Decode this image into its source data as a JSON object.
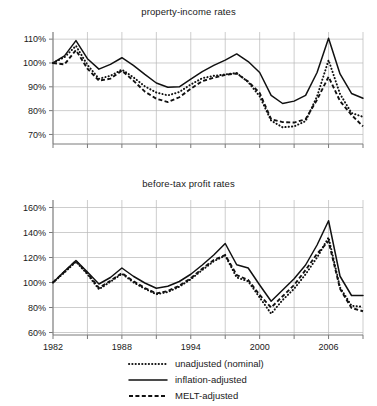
{
  "figure": {
    "width": 377,
    "height": 406,
    "background": "#ffffff",
    "ink_color": "#111111",
    "grid_color": "#b8b8b8",
    "axis_color": "#7a7a7a"
  },
  "legend": {
    "position": "bottom-center",
    "entries": [
      {
        "label": "unadjusted (nominal)",
        "style": "dotted",
        "name": "legend-item-unadjusted"
      },
      {
        "label": "inflation-adjusted",
        "style": "solid",
        "name": "legend-item-inflation-adjusted"
      },
      {
        "label": "MELT-adjusted",
        "style": "dashed",
        "name": "legend-item-melt-adjusted"
      }
    ]
  },
  "chart_data": [
    {
      "type": "line",
      "title": "property-income rates",
      "xlabel": "",
      "ylabel": "",
      "grid": true,
      "legend_position": "bottom-center",
      "xlim": [
        1982,
        1908.0
      ],
      "x_axis_range": [
        1982,
        2009
      ],
      "ylim": [
        66,
        113
      ],
      "yticks": [
        70,
        80,
        90,
        100,
        110
      ],
      "ytick_labels": [
        "70%",
        "80%",
        "90%",
        "100%",
        "110%"
      ],
      "xticks": [
        1982,
        1985,
        1988,
        1991,
        1994,
        1997,
        2000,
        2003,
        2006,
        2009
      ],
      "xtick_labels": [
        "1982",
        "",
        "1988",
        "",
        "1994",
        "",
        "2000",
        "",
        "2006",
        ""
      ],
      "x": [
        1982,
        1983,
        1984,
        1985,
        1986,
        1987,
        1988,
        1989,
        1990,
        1991,
        1992,
        1993,
        1994,
        1995,
        1996,
        1997,
        1998,
        1999,
        2000,
        2001,
        2002,
        2003,
        2004,
        2005,
        2006,
        2007,
        2008,
        2009
      ],
      "series": [
        {
          "name": "inflation-adjusted",
          "style": "solid",
          "values": [
            100.0,
            103.0,
            109.4,
            101.8,
            97.4,
            99.4,
            102.2,
            99.0,
            95.2,
            91.6,
            89.8,
            90.0,
            93.2,
            96.4,
            99.0,
            101.2,
            103.8,
            100.6,
            96.0,
            86.4,
            83.0,
            84.0,
            86.4,
            96.0,
            110.4,
            95.4,
            87.2,
            85.2
          ]
        },
        {
          "name": "unadjusted (nominal)",
          "style": "dotted",
          "values": [
            100.0,
            102.4,
            107.2,
            99.2,
            93.4,
            94.6,
            97.2,
            94.0,
            90.2,
            87.6,
            86.4,
            87.8,
            91.0,
            93.6,
            94.6,
            95.2,
            95.8,
            92.0,
            86.0,
            75.8,
            73.0,
            73.4,
            75.6,
            86.0,
            101.2,
            87.0,
            79.0,
            77.4
          ]
        },
        {
          "name": "MELT-adjusted",
          "style": "dashed",
          "values": [
            100.0,
            99.4,
            105.4,
            97.6,
            92.6,
            93.4,
            96.8,
            92.6,
            88.0,
            85.0,
            83.6,
            85.6,
            89.2,
            92.4,
            93.8,
            95.0,
            95.6,
            92.2,
            87.4,
            76.4,
            75.2,
            75.0,
            76.4,
            84.6,
            94.2,
            84.0,
            78.2,
            73.4
          ]
        }
      ]
    },
    {
      "type": "line",
      "title": "before-tax profit rates",
      "xlabel": "",
      "ylabel": "",
      "grid": true,
      "legend_position": "bottom-center",
      "x_axis_range": [
        1982,
        2009
      ],
      "ylim": [
        58,
        166
      ],
      "yticks": [
        60,
        80,
        100,
        120,
        140,
        160
      ],
      "ytick_labels": [
        "60%",
        "80%",
        "100%",
        "120%",
        "140%",
        "160%"
      ],
      "xticks": [
        1982,
        1985,
        1988,
        1991,
        1994,
        1997,
        2000,
        2003,
        2006,
        2009
      ],
      "xtick_labels": [
        "1982",
        "",
        "1988",
        "",
        "1994",
        "",
        "2000",
        "",
        "2006",
        ""
      ],
      "x": [
        1982,
        1983,
        1984,
        1985,
        1986,
        1987,
        1988,
        1989,
        1990,
        1991,
        1992,
        1993,
        1994,
        1995,
        1996,
        1997,
        1998,
        1999,
        2000,
        2001,
        2002,
        2003,
        2004,
        2005,
        2006,
        2007,
        2008,
        2009
      ],
      "series": [
        {
          "name": "inflation-adjusted",
          "style": "solid",
          "values": [
            100.0,
            109.0,
            117.6,
            108.4,
            98.8,
            104.0,
            111.6,
            105.0,
            99.6,
            95.4,
            97.0,
            100.8,
            106.6,
            114.0,
            122.0,
            131.2,
            114.2,
            111.6,
            98.0,
            85.0,
            94.0,
            103.0,
            114.0,
            130.0,
            149.4,
            105.0,
            89.6,
            89.6
          ]
        },
        {
          "name": "unadjusted (nominal)",
          "style": "dotted",
          "values": [
            100.0,
            108.0,
            116.6,
            106.6,
            94.6,
            100.6,
            107.0,
            100.2,
            95.0,
            90.6,
            92.4,
            96.6,
            102.6,
            110.0,
            117.0,
            121.6,
            104.0,
            101.0,
            88.0,
            75.0,
            86.0,
            95.0,
            106.6,
            120.0,
            136.0,
            96.0,
            81.4,
            80.6
          ]
        },
        {
          "name": "MELT-adjusted",
          "style": "dashed",
          "values": [
            100.0,
            108.6,
            117.2,
            107.4,
            95.6,
            101.4,
            107.6,
            101.0,
            95.6,
            91.2,
            93.2,
            97.4,
            103.4,
            111.0,
            118.0,
            122.0,
            106.0,
            102.0,
            90.0,
            80.0,
            89.0,
            98.0,
            110.0,
            123.0,
            133.0,
            95.0,
            79.6,
            77.0
          ]
        }
      ]
    }
  ]
}
